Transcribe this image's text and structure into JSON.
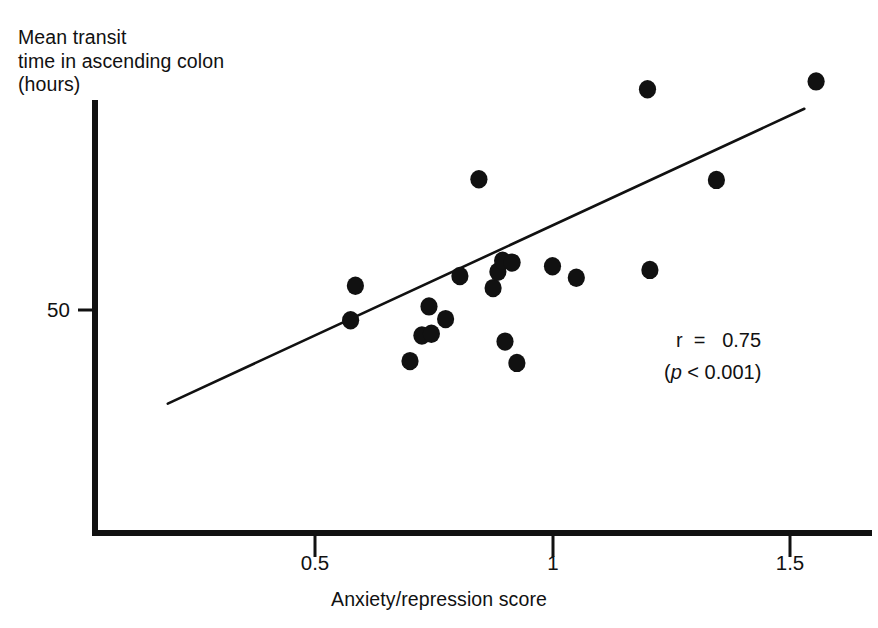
{
  "chart_data": {
    "type": "scatter",
    "title": "",
    "subtitle": "",
    "xlabel": "Anxiety/repression score",
    "ylabel": "Mean transit time in ascending colon (hours)",
    "ylabel_lines": [
      "Mean transit",
      "time in ascending colon",
      "(hours)"
    ],
    "xlim": [
      0.12,
      1.6
    ],
    "ylim": [
      18,
      92
    ],
    "xticks": [
      0.5,
      1,
      1.5
    ],
    "xtick_labels": [
      "0.5",
      "1",
      "1.5"
    ],
    "yticks": [
      50
    ],
    "ytick_labels": [
      "50"
    ],
    "grid": false,
    "legend": "none",
    "marker": "filled-circle",
    "marker_color": "#111111",
    "x": [
      0.575,
      0.585,
      0.7,
      0.725,
      0.745,
      0.74,
      0.775,
      0.805,
      0.845,
      0.875,
      0.885,
      0.9,
      0.895,
      0.915,
      0.925,
      1.0,
      1.05,
      1.2,
      1.205,
      1.345,
      1.555
    ],
    "y": [
      48.3,
      54.0,
      41.6,
      45.8,
      46.1,
      50.6,
      48.5,
      55.6,
      71.5,
      53.6,
      56.3,
      44.8,
      58.1,
      57.8,
      41.3,
      57.2,
      55.3,
      86.3,
      56.6,
      71.4,
      87.6
    ],
    "points": [
      {
        "x": 0.575,
        "y": 48.3
      },
      {
        "x": 0.585,
        "y": 54.0
      },
      {
        "x": 0.7,
        "y": 41.6
      },
      {
        "x": 0.725,
        "y": 45.8
      },
      {
        "x": 0.745,
        "y": 46.1
      },
      {
        "x": 0.74,
        "y": 50.6
      },
      {
        "x": 0.775,
        "y": 48.5
      },
      {
        "x": 0.805,
        "y": 55.6
      },
      {
        "x": 0.845,
        "y": 71.5
      },
      {
        "x": 0.875,
        "y": 53.6
      },
      {
        "x": 0.885,
        "y": 56.3
      },
      {
        "x": 0.9,
        "y": 44.8
      },
      {
        "x": 0.895,
        "y": 58.1
      },
      {
        "x": 0.915,
        "y": 57.8
      },
      {
        "x": 0.925,
        "y": 41.3
      },
      {
        "x": 1.0,
        "y": 57.2
      },
      {
        "x": 1.05,
        "y": 55.3
      },
      {
        "x": 1.2,
        "y": 86.3
      },
      {
        "x": 1.205,
        "y": 56.6
      },
      {
        "x": 1.345,
        "y": 71.4
      },
      {
        "x": 1.555,
        "y": 87.6
      }
    ],
    "fit_line": {
      "type": "linear-regression",
      "x_start": 0.19,
      "y_start": 34.6,
      "x_end": 1.53,
      "y_end": 83.1
    },
    "annotations": {
      "correlation_label": "r",
      "correlation_equals": "=",
      "correlation_value": "0.75",
      "pvalue_text": "(",
      "pvalue_symbol": "p",
      "pvalue_operator": "<",
      "pvalue_number": "0.001",
      "pvalue_close": ")",
      "correlation_full": "r  =   0.75",
      "pvalue_full": "(p < 0.001)"
    },
    "colors": {
      "axis": "#111111",
      "marker": "#111111",
      "line": "#111111",
      "background": "#ffffff",
      "text": "#111111"
    }
  }
}
